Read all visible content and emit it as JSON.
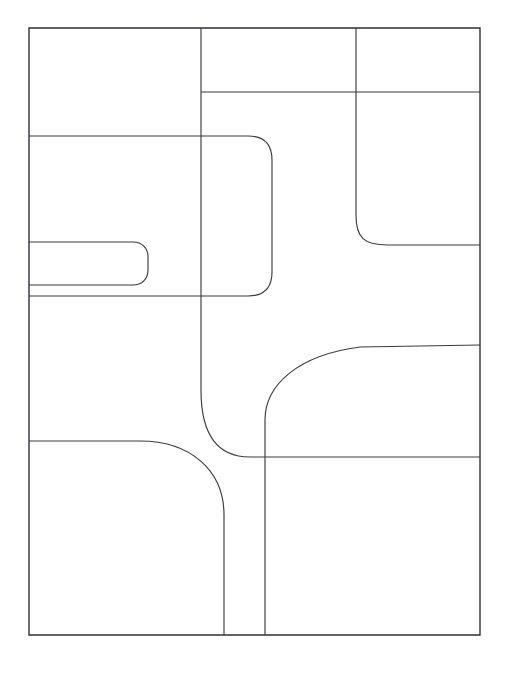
{
  "document": {
    "title": "Abstract Line Partition Diagram",
    "background_color": "#ffffff",
    "stroke_color": "#3b3b42",
    "canvas_width": 514,
    "canvas_height": 680
  },
  "figure": {
    "name": "line-art-partition-diagram",
    "frame": {
      "x": 29,
      "y": 28,
      "width": 451,
      "height": 607,
      "stroke_width": 1.4
    },
    "paths": [
      {
        "id": "outer-frame",
        "name": "outer-frame-rectangle",
        "kind": "rectangle",
        "d": "M29,28 L480,28 L480,635 L29,635 Z",
        "stroke_width": 1.4
      },
      {
        "id": "top-divider-horizontal",
        "name": "top-horizontal-divider",
        "kind": "line",
        "d": "M201,92 L480,92",
        "stroke_width": 1.15
      },
      {
        "id": "top-vertical-right",
        "name": "upper-right-vertical-divider",
        "kind": "line",
        "d": "M356,28 L356,215",
        "stroke_width": 1.15
      },
      {
        "id": "right-curve-to-edge",
        "name": "upper-right-rounded-elbow",
        "kind": "curve",
        "d": "M356,215 C356,238 364,245 388,245 L480,245",
        "stroke_width": 1.15
      },
      {
        "id": "left-band-top",
        "name": "left-band-top-horizontal",
        "kind": "line",
        "d": "M29,136 L248,136",
        "stroke_width": 1.15
      },
      {
        "id": "big-rounded-right-lobe",
        "name": "large-rounded-lobe-outline",
        "kind": "curve",
        "d": "M248,136 C264,136 272,144 272,160 L272,272 C272,288 264,296 248,296 L29,296",
        "stroke_width": 1.15
      },
      {
        "id": "left-band-bottom",
        "name": "left-band-bottom-horizontal",
        "kind": "line",
        "d": "M29,285 L133,285",
        "stroke_width": 1.15
      },
      {
        "id": "small-rounded-slot",
        "name": "small-rounded-slot-outline",
        "kind": "curve",
        "d": "M29,242 L133,242 C142,242 148,248 148,257 L148,270 C148,279 142,285 133,285",
        "stroke_width": 1.15
      },
      {
        "id": "center-vertical-upper",
        "name": "center-vertical-divider-upper",
        "kind": "line",
        "d": "M201,28 L201,390",
        "stroke_width": 1.15
      },
      {
        "id": "center-vertical-elbow",
        "name": "center-vertical-to-right-elbow",
        "kind": "curve",
        "d": "M201,390 C201,432 216,457 250,457 L480,457",
        "stroke_width": 1.15
      },
      {
        "id": "sweep-curve-upper-right",
        "name": "large-sweep-curve-to-right-edge",
        "kind": "curve",
        "d": "M265,457 L265,420 C265,385 298,355 360,347 L480,345",
        "stroke_width": 1.15
      },
      {
        "id": "bottom-center-vertical",
        "name": "bottom-center-vertical-divider",
        "kind": "line",
        "d": "M265,457 L265,635",
        "stroke_width": 1.15
      },
      {
        "id": "lower-left-rounded",
        "name": "lower-left-rounded-corner-partition",
        "kind": "curve",
        "d": "M29,441 L140,441 C190,441 224,470 224,515 L224,635",
        "stroke_width": 1.15
      }
    ],
    "cells": [
      {
        "id": "cell-top-left",
        "name": "region-top-left",
        "label": ""
      },
      {
        "id": "cell-top-middle",
        "name": "region-top-middle",
        "label": ""
      },
      {
        "id": "cell-top-right",
        "name": "region-top-right",
        "label": ""
      },
      {
        "id": "cell-left-band",
        "name": "region-left-band",
        "label": ""
      },
      {
        "id": "cell-slot",
        "name": "region-small-slot",
        "label": ""
      },
      {
        "id": "cell-center-lobe",
        "name": "region-center-lobe",
        "label": ""
      },
      {
        "id": "cell-right-upper",
        "name": "region-right-upper",
        "label": ""
      },
      {
        "id": "cell-right-middle",
        "name": "region-right-middle",
        "label": ""
      },
      {
        "id": "cell-center-open",
        "name": "region-center-open",
        "label": ""
      },
      {
        "id": "cell-bottom-left",
        "name": "region-bottom-left",
        "label": ""
      },
      {
        "id": "cell-bottom-right",
        "name": "region-bottom-right",
        "label": ""
      }
    ]
  }
}
